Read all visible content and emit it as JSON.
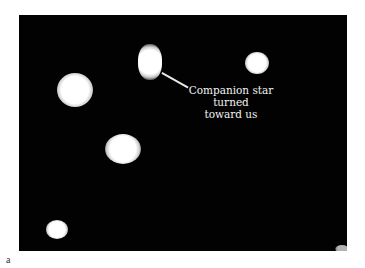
{
  "figure": {
    "annotation": {
      "line1": "Companion star",
      "line2": "turned",
      "line3": "toward us"
    },
    "panel_label": "a",
    "colors": {
      "background": "#020202",
      "stars": "#ffffff",
      "page": "#ffffff"
    }
  }
}
